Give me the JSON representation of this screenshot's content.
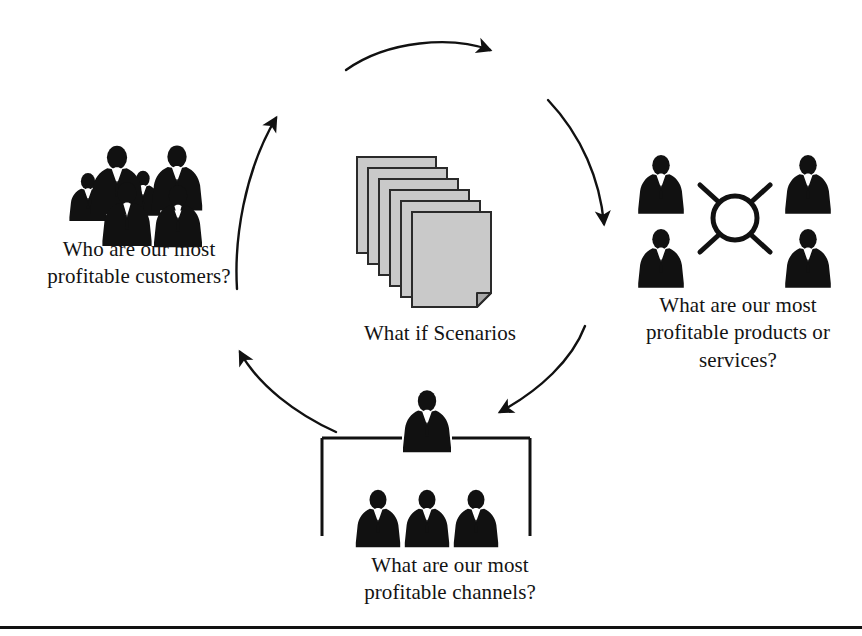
{
  "diagram": {
    "type": "cycle-diagram",
    "direction": "clockwise",
    "background_color": "#ffffff",
    "ink_color": "#111111",
    "document_fill_color": "#c8c8c8"
  },
  "center": {
    "icon": "document-stack-icon",
    "page_count": 6,
    "caption": "What if Scenarios"
  },
  "nodes": [
    {
      "id": "customers",
      "position": "top-left",
      "icon": "crowd-of-people-icon",
      "figure_count": 6,
      "caption": "Who are our most\nprofitable customers?"
    },
    {
      "id": "products",
      "position": "right",
      "icon": "hub-and-spoke-people-icon",
      "figure_count": 4,
      "caption": "What are our most\nprofitable products or\nservices?"
    },
    {
      "id": "channels",
      "position": "bottom",
      "icon": "org-chart-people-icon",
      "figure_count": 4,
      "caption": "What are our most\nprofitable channels?"
    }
  ],
  "arrows": [
    {
      "id": "arrow-top",
      "from": "customers",
      "to": "products",
      "label": "top arc pointing right"
    },
    {
      "id": "arrow-upper-right",
      "from": "top",
      "to": "products",
      "label": "upper right arc pointing down"
    },
    {
      "id": "arrow-lower-right",
      "from": "products",
      "to": "channels",
      "label": "lower right arc pointing down-left"
    },
    {
      "id": "arrow-lower-left",
      "from": "channels",
      "to": "customers",
      "label": "lower left arc pointing up-left"
    },
    {
      "id": "arrow-upper-left",
      "from": "customers",
      "to": "top",
      "label": "upper left arc pointing up-right"
    }
  ],
  "footer": {
    "rule": "horizontal-divider"
  }
}
